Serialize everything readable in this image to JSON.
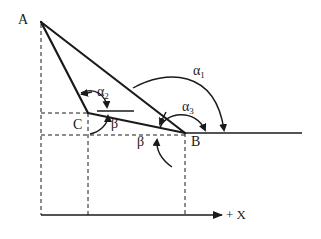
{
  "diagram": {
    "type": "vector-geometry",
    "points": {
      "A": {
        "label": "A",
        "x": 41,
        "y": 22
      },
      "B": {
        "label": "B",
        "x": 185,
        "y": 133
      },
      "C": {
        "label": "C",
        "x": 88,
        "y": 113
      }
    },
    "angles": {
      "alpha1": {
        "label": "α",
        "sub": "1"
      },
      "alpha2": {
        "label": "α",
        "sub": "2"
      },
      "alpha3": {
        "label": "α",
        "sub": "3"
      },
      "beta_at_C": {
        "label": "β"
      },
      "beta_at_B": {
        "label": "β"
      }
    },
    "axis": {
      "label": "+ X"
    },
    "colors": {
      "stroke": "#1a1a1a",
      "background": "#ffffff"
    }
  }
}
